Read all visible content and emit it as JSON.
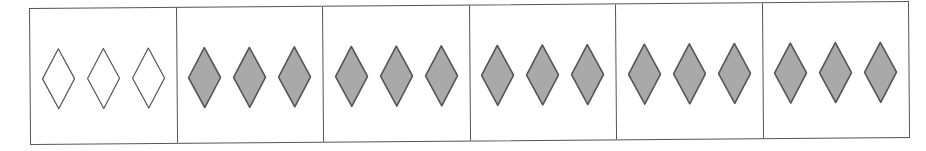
{
  "figure": {
    "colors": {
      "border": "#555555",
      "outline": "#555555",
      "filled": "#a9a9a9",
      "empty": "#ffffff"
    },
    "cells": [
      {
        "index": 1,
        "count": 3,
        "fill": "empty"
      },
      {
        "index": 2,
        "count": 3,
        "fill": "filled"
      },
      {
        "index": 3,
        "count": 3,
        "fill": "filled"
      },
      {
        "index": 4,
        "count": 3,
        "fill": "filled"
      },
      {
        "index": 5,
        "count": 3,
        "fill": "filled"
      },
      {
        "index": 6,
        "count": 3,
        "fill": "filled"
      }
    ]
  }
}
